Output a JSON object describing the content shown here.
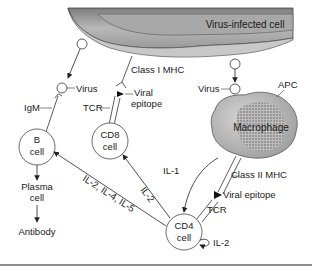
{
  "diagram": {
    "infected_cell": {
      "label": "Virus-infected cell"
    },
    "b_cell": {
      "line1": "B",
      "line2": "cell"
    },
    "cd8_cell": {
      "line1": "CD8",
      "line2": "cell"
    },
    "cd4_cell": {
      "line1": "CD4",
      "line2": "cell"
    },
    "macrophage": {
      "label": "Macrophage",
      "apc_label": "APC"
    },
    "labels": {
      "virus_left": "Virus",
      "virus_right": "Virus",
      "igm": "IgM",
      "class_i_mhc": "Class I MHC",
      "viral_epitope_1_line1": "Viral",
      "viral_epitope_1_line2": "epitope",
      "tcr_cd8": "TCR",
      "class_ii_mhc": "Class II MHC",
      "viral_epitope_2": "Viral epitope",
      "tcr_cd4": "TCR",
      "il1": "IL-1",
      "il2_cd8": "IL-2",
      "il_b": "IL-2, IL-4, IL-5",
      "il2_self": "IL-2",
      "plasma_line1": "Plasma",
      "plasma_line2": "cell",
      "antibody": "Antibody"
    },
    "colors": {
      "cell_fill_dark": "#8a8a8a",
      "cell_fill_light": "#c4c4c4",
      "stroke": "#333333",
      "rule": "#666666"
    }
  }
}
